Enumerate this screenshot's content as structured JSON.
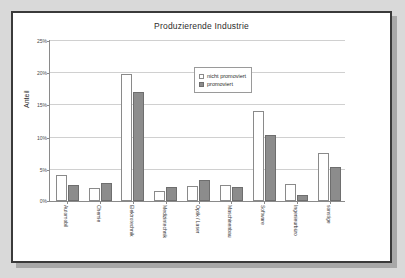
{
  "slide": {
    "background_color": "#ffffff",
    "border_color": "#3a3a3a",
    "page_background_color": "#d9d9d9"
  },
  "chart_data": {
    "type": "bar",
    "title": "Produzierende Industrie",
    "xlabel": "",
    "ylabel": "Anteil",
    "ylim": [
      0,
      25
    ],
    "grid": true,
    "legend_position": "top-center",
    "ytick_labels": [
      "0%",
      "5%",
      "10%",
      "15%",
      "20%",
      "25%"
    ],
    "ytick_values": [
      0,
      5,
      10,
      15,
      20,
      25
    ],
    "categories": [
      "Automobil",
      "Chemie",
      "Elektrotechnik",
      "Medizintechnik",
      "Optik / Laser",
      "Maschinenbau",
      "Software",
      "Ingenieurbüro",
      "sonstige"
    ],
    "series": [
      {
        "name": "nicht promoviert",
        "color": "#ffffff",
        "border_color": "#8a8a8a",
        "values": [
          4.0,
          2.0,
          19.8,
          1.6,
          2.4,
          2.5,
          14.0,
          2.7,
          7.5
        ]
      },
      {
        "name": "promoviert",
        "color": "#8c8c8c",
        "border_color": "#6e6e6e",
        "values": [
          2.5,
          2.8,
          17.0,
          2.2,
          3.2,
          2.2,
          10.2,
          1.0,
          5.3
        ]
      }
    ]
  }
}
